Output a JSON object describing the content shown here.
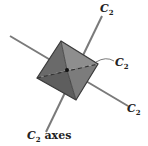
{
  "diagram": {
    "labels": {
      "top": {
        "symbol": "C",
        "subscript": "2"
      },
      "right_mid": {
        "symbol": "C",
        "subscript": "2"
      },
      "right_low": {
        "symbol": "C",
        "subscript": "2"
      },
      "caption": {
        "symbol": "C",
        "subscript": "2",
        "text": "axes"
      }
    },
    "colors": {
      "axis": "#7a7a7a",
      "face_dark": "#6e6e6e",
      "face_light": "#8c8c8c",
      "edge": "#3a3a3a",
      "dashed": "#333333"
    }
  }
}
